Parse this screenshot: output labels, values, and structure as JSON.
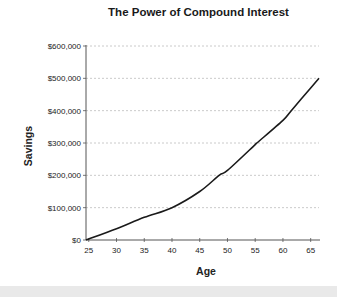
{
  "chart_data": {
    "type": "line",
    "title": "The Power of Compound Interest",
    "xlabel": "Age",
    "ylabel": "Savings",
    "x_ticks": [
      25,
      30,
      35,
      40,
      45,
      50,
      55,
      60,
      65
    ],
    "y_ticks": [
      "$0",
      "$100,000",
      "$200,000",
      "$300,000",
      "$400,000",
      "$500,000",
      "$600,000"
    ],
    "xlim": [
      24.5,
      66.5
    ],
    "ylim": [
      0,
      600000
    ],
    "grid": "horizontal dashed",
    "legend": "none",
    "series": [
      {
        "name": "Savings",
        "color": "#1a1a1a",
        "x": [
          24.5,
          30,
          35,
          40,
          45,
          48.5,
          50,
          55,
          55.3,
          60,
          61.5,
          65,
          66.5
        ],
        "values": [
          0,
          35000,
          70000,
          100000,
          150000,
          200000,
          215000,
          295000,
          300000,
          370000,
          400000,
          470000,
          500000
        ]
      }
    ]
  },
  "colors": {
    "line": "#1a1a1a",
    "grid": "#bdbdbd",
    "axis": "#555555",
    "footer_band": "#e9e9e9"
  }
}
